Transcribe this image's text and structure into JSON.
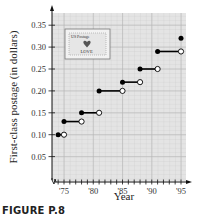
{
  "chart_data": {
    "type": "line",
    "subtype": "step",
    "title": "",
    "xlabel": "Year",
    "ylabel": "First-class postage (in dollars)",
    "x_ticks": [
      "'75",
      "'80",
      "'85",
      "'90",
      "'95"
    ],
    "y_ticks": [
      "0.05",
      "0.10",
      "0.15",
      "0.20",
      "0.25",
      "0.30",
      "0.35"
    ],
    "xlim": [
      1973.5,
      1996
    ],
    "ylim": [
      0,
      0.37
    ],
    "grid": true,
    "legend": null,
    "series": [
      {
        "name": "First-class postage",
        "steps": [
          {
            "start": 1974,
            "end": 1975,
            "value": 0.1
          },
          {
            "start": 1975,
            "end": 1978,
            "value": 0.13
          },
          {
            "start": 1978,
            "end": 1981,
            "value": 0.15
          },
          {
            "start": 1981,
            "end": 1985,
            "value": 0.2
          },
          {
            "start": 1985,
            "end": 1988,
            "value": 0.22
          },
          {
            "start": 1988,
            "end": 1991,
            "value": 0.25
          },
          {
            "start": 1991,
            "end": 1995,
            "value": 0.29
          },
          {
            "start": 1995,
            "end": null,
            "value": 0.32
          }
        ]
      }
    ],
    "annotations": [
      {
        "type": "stamp-image",
        "text_top": "US Postage",
        "text_bottom": "LOVE",
        "icon": "heart-icon"
      }
    ]
  },
  "caption": "FIGURE P.8",
  "stamp": {
    "top": "US Postage",
    "bottom": "LOVE"
  }
}
